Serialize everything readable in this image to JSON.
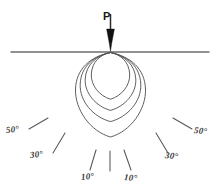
{
  "figure": {
    "kind": "pressure-bulb-diagram",
    "background_color": "#ffffff",
    "stroke_color": "#55565a",
    "ground_line_color": "#6d6e71",
    "arrow_color": "#1a1a1a",
    "text_color": "#3a3a3a"
  },
  "load": {
    "label": "P",
    "arrow_direction": "down",
    "apply_point_x": 110,
    "apply_point_y": 52
  },
  "ground_line": {
    "x_start": 11,
    "x_end": 209,
    "y": 52
  },
  "bulbs": [
    {
      "name": "bulb-1-innermost",
      "half_width": 19,
      "depth": 47
    },
    {
      "name": "bulb-2",
      "half_width": 25,
      "depth": 58
    },
    {
      "name": "bulb-3",
      "half_width": 30,
      "depth": 70
    },
    {
      "name": "bulb-4-outermost",
      "half_width": 35,
      "depth": 85
    }
  ],
  "angle_ticks": [
    {
      "name": "tick-left-50",
      "label": "50°",
      "x1": 48,
      "y1": 118,
      "x2": 29,
      "y2": 129,
      "label_x": 7,
      "label_y": 125
    },
    {
      "name": "tick-left-30",
      "label": "30°",
      "x1": 65,
      "y1": 133,
      "x2": 53,
      "y2": 153,
      "label_x": 31,
      "label_y": 150
    },
    {
      "name": "tick-left-10",
      "label": "10°",
      "x1": 96,
      "y1": 150,
      "x2": 90,
      "y2": 170,
      "label_x": 82,
      "label_y": 172
    },
    {
      "name": "tick-center",
      "label": "",
      "x1": 110,
      "y1": 151,
      "x2": 110,
      "y2": 171,
      "label_x": 0,
      "label_y": 0
    },
    {
      "name": "tick-right-10",
      "label": "10°",
      "x1": 124,
      "y1": 150,
      "x2": 131,
      "y2": 170,
      "label_x": 124,
      "label_y": 172
    },
    {
      "name": "tick-right-30",
      "label": "30°",
      "x1": 156,
      "y1": 133,
      "x2": 168,
      "y2": 153,
      "label_x": 166,
      "label_y": 150
    },
    {
      "name": "tick-right-50",
      "label": "50°",
      "x1": 173,
      "y1": 118,
      "x2": 192,
      "y2": 129,
      "label_x": 195,
      "label_y": 125
    }
  ],
  "labels": {
    "left_50": "50°",
    "left_30": "30°",
    "left_10": "10°",
    "right_10": "10°",
    "right_30": "30°",
    "right_50": "50°",
    "load": "P"
  }
}
